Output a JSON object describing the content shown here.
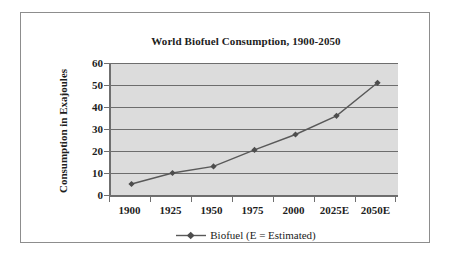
{
  "chart_data": {
    "type": "line",
    "title": "World Biofuel Consumption, 1900-2050",
    "xlabel": "",
    "ylabel": "Consumption in Exajoules",
    "categories": [
      "1900",
      "1925",
      "1950",
      "1975",
      "2000",
      "2025E",
      "2050E"
    ],
    "series": [
      {
        "name": "Biofuel (E = Estimated)",
        "values": [
          5,
          10,
          13,
          20.5,
          27.5,
          36,
          51
        ]
      }
    ],
    "ylim": [
      0,
      60
    ],
    "y_ticks": [
      "60",
      "50",
      "40",
      "30",
      "20",
      "10",
      "0"
    ],
    "y_tick_values": [
      60,
      50,
      40,
      30,
      20,
      10,
      0
    ],
    "grid": "horizontal",
    "legend_position": "bottom",
    "plot_background": "#dcdcdc",
    "series_color": "#595959",
    "marker": "diamond"
  },
  "legend": {
    "entry_label": "Biofuel (E = Estimated)",
    "swatch_name": "line-with-marker"
  },
  "frame": {
    "border_color": "#8d8d8d"
  }
}
